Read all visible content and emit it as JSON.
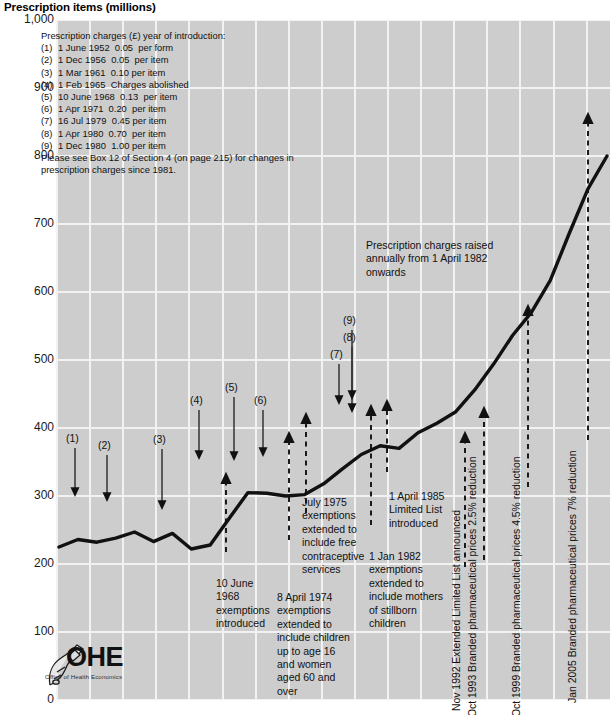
{
  "title": "Prescription items (millions)",
  "axis": {
    "y_ticks": [
      "1,000",
      "900",
      "800",
      "700",
      "600",
      "500",
      "400",
      "300",
      "200",
      "100",
      "0"
    ],
    "y_values": [
      1000,
      900,
      800,
      700,
      600,
      500,
      400,
      300,
      200,
      100,
      0
    ]
  },
  "legend": {
    "heading": "Prescription charges (£) year of introduction:",
    "rows": [
      {
        "num": "(1)",
        "text": "1 June 1952  0.05  per form"
      },
      {
        "num": "(2)",
        "text": "1 Dec 1956  0.05  per item"
      },
      {
        "num": "(3)",
        "text": "1 Mar 1961  0.10 per item"
      },
      {
        "num": "(4)",
        "text": "1 Feb 1965  Charges abolished"
      },
      {
        "num": "(5)",
        "text": "10 June 1968  0.13  per item"
      },
      {
        "num": "(6)",
        "text": "1 Apr 1971  0.20  per item"
      },
      {
        "num": "(7)",
        "text": "16 Jul 1979  0.45 per item"
      },
      {
        "num": "(8)",
        "text": "1 Apr 1980  0.70  per item"
      },
      {
        "num": "(9)",
        "text": "1 Dec 1980  1.00 per item"
      }
    ],
    "footnote_line1": "Please see Box 12 of Section 4 (on page 215) for changes in",
    "footnote_line2": "prescription charges since 1981."
  },
  "markers": [
    {
      "label": "(1)",
      "x": 66,
      "y": 432
    },
    {
      "label": "(2)",
      "x": 98,
      "y": 439
    },
    {
      "label": "(3)",
      "x": 153,
      "y": 433
    },
    {
      "label": "(4)",
      "x": 190,
      "y": 394
    },
    {
      "label": "(5)",
      "x": 225,
      "y": 381
    },
    {
      "label": "(6)",
      "x": 254,
      "y": 394
    },
    {
      "label": "(7)",
      "x": 330,
      "y": 348
    },
    {
      "label": "(8)",
      "x": 343,
      "y": 331
    },
    {
      "label": "(9)",
      "x": 343,
      "y": 314
    }
  ],
  "annotations": [
    {
      "name": "prescription-charges-raised",
      "lines": [
        "Prescription charges raised",
        "annually from 1 April 1982",
        "onwards"
      ],
      "x": 366,
      "y": 239,
      "align": "left"
    },
    {
      "name": "july-1975-exemptions",
      "lines": [
        "July 1975",
        "exemptions",
        "extended to",
        "include free",
        "contraceptive",
        "services"
      ],
      "x": 302,
      "y": 496,
      "align": "left"
    },
    {
      "name": "ten-june-1968-exemptions",
      "lines": [
        "10 June",
        "1968",
        "exemptions",
        "introduced"
      ],
      "x": 216,
      "y": 577,
      "align": "left"
    },
    {
      "name": "eight-april-1974-exemptions",
      "lines": [
        "8 April 1974",
        "exemptions",
        "extended to",
        "include children",
        "up to age 16",
        "and women",
        "aged 60 and",
        "over"
      ],
      "x": 277,
      "y": 591,
      "align": "left"
    },
    {
      "name": "one-jan-1982-exemptions",
      "lines": [
        "1 Jan 1982",
        "exemptions",
        "extended to",
        "include mothers",
        "of stillborn",
        "children"
      ],
      "x": 369,
      "y": 550,
      "align": "left"
    },
    {
      "name": "one-april-1985-limited-list",
      "lines": [
        "1 April 1985",
        "Limited List",
        "introduced"
      ],
      "x": 389,
      "y": 490,
      "align": "left"
    }
  ],
  "vertical_annotations": [
    {
      "name": "nov-1992-extended-limited-list",
      "text": "Nov 1992 Extended Limited List announced",
      "x": 462,
      "y": 700
    },
    {
      "name": "oct-1993-branded-prices",
      "text": "Oct 1993 Branded pharmaceutical prices 2.5% reduction",
      "x": 478,
      "y": 706
    },
    {
      "name": "oct-1999-branded-prices",
      "text": "Oct 1999 Branded pharmaceutical prices 4.5% reduction",
      "x": 522,
      "y": 706
    },
    {
      "name": "jan-2005-branded-prices",
      "text": "Jan 2005 Branded pharmaceutical prices 7% reduction",
      "x": 578,
      "y": 692
    }
  ],
  "logo": {
    "mark": "OHE",
    "subtitle": "Office of Health Economics"
  },
  "colors": {
    "plot_background": "#cdcdcd",
    "gridline": "#f2f2f2",
    "series_line": "#111111",
    "text": "#111111",
    "page_background": "#ffffff"
  },
  "chart_data": {
    "type": "line",
    "title": "Prescription items (millions)",
    "xlabel": "",
    "ylabel": "Prescription items (millions)",
    "ylim": [
      0,
      1000
    ],
    "grid": true,
    "legend_position": "none",
    "x": [
      1949,
      1951,
      1953,
      1955,
      1957,
      1959,
      1961,
      1963,
      1965,
      1967,
      1969,
      1971,
      1973,
      1975,
      1977,
      1979,
      1981,
      1983,
      1985,
      1987,
      1989,
      1991,
      1993,
      1995,
      1997,
      1999,
      2001,
      2003,
      2005,
      2007
    ],
    "series": [
      {
        "name": "Prescription items",
        "values": [
          225,
          236,
          232,
          238,
          247,
          233,
          245,
          222,
          228,
          267,
          305,
          304,
          300,
          302,
          318,
          340,
          361,
          374,
          370,
          393,
          407,
          424,
          456,
          494,
          536,
          570,
          617,
          686,
          752,
          800
        ]
      }
    ],
    "annotation_points": [
      {
        "label": "(1)",
        "note": "1 June 1952  0.05 per form"
      },
      {
        "label": "(2)",
        "note": "1 Dec 1956  0.05 per item"
      },
      {
        "label": "(3)",
        "note": "1 Mar 1961  0.10 per item"
      },
      {
        "label": "(4)",
        "note": "1 Feb 1965  Charges abolished"
      },
      {
        "label": "(5)",
        "note": "10 June 1968  0.13 per item"
      },
      {
        "label": "(6)",
        "note": "1 Apr 1971  0.20 per item"
      },
      {
        "label": "(7)",
        "note": "16 Jul 1979  0.45 per item"
      },
      {
        "label": "(8)",
        "note": "1 Apr 1980  0.70 per item"
      },
      {
        "label": "(9)",
        "note": "1 Dec 1980  1.00 per item"
      }
    ]
  }
}
